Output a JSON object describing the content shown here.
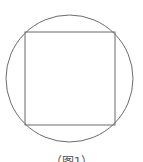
{
  "diagram": {
    "type": "geometry",
    "stroke_color": "#6b6b6b",
    "circle": {
      "cx": 69.5,
      "cy": 78.5,
      "r": 63.5
    },
    "square": {
      "x": 25,
      "y": 32,
      "width": 90,
      "height": 93
    },
    "caption": "（图1）"
  }
}
